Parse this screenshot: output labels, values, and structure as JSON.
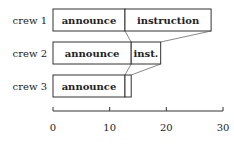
{
  "chart_data": {
    "type": "bar",
    "orientation": "horizontal-stacked",
    "title": "",
    "xlabel": "",
    "ylabel": "",
    "xlim": [
      0,
      30
    ],
    "xticks": [
      0,
      10,
      20,
      30
    ],
    "grid": false,
    "legend": null,
    "categories": [
      "crew 1",
      "crew 2",
      "crew 3"
    ],
    "series": [
      {
        "name": "announce",
        "values": [
          12.7,
          13.8,
          12.7
        ],
        "labels": [
          "announce",
          "announce",
          "announce"
        ]
      },
      {
        "name": "instruction",
        "values": [
          15.2,
          5.2,
          1.1
        ],
        "labels": [
          "instruction",
          "inst.",
          ""
        ]
      }
    ],
    "annotations": [
      "connector lines link boundary between consecutive crews' bars (announce end and instruction end)"
    ]
  },
  "colors": {
    "stroke": "#333333",
    "fill": "#ffffff",
    "connector": "#555555"
  }
}
